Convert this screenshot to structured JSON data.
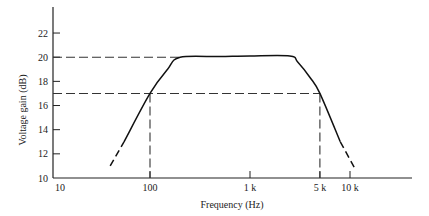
{
  "chart_data": {
    "type": "line",
    "title": "",
    "xlabel": "Frequency (Hz)",
    "ylabel": "Voltage gain (dB)",
    "xscale": "log",
    "xlim": [
      10,
      40000
    ],
    "ylim": [
      10,
      24
    ],
    "grid": false,
    "legend": null,
    "x_ticks": [
      {
        "value": 10,
        "label": "10"
      },
      {
        "value": 100,
        "label": "100"
      },
      {
        "value": 1000,
        "label": "1 k"
      },
      {
        "value": 5000,
        "label": "5 k"
      },
      {
        "value": 10000,
        "label": "10 k"
      }
    ],
    "y_ticks": [
      {
        "value": 10,
        "label": "10"
      },
      {
        "value": 12,
        "label": "12"
      },
      {
        "value": 14,
        "label": "14"
      },
      {
        "value": 16,
        "label": "16"
      },
      {
        "value": 18,
        "label": "18"
      },
      {
        "value": 20,
        "label": "20"
      },
      {
        "value": 22,
        "label": "22"
      }
    ],
    "series": [
      {
        "name": "Frequency response",
        "style": "solid",
        "points": [
          {
            "x": 55,
            "y": 13.0
          },
          {
            "x": 100,
            "y": 17.0
          },
          {
            "x": 150,
            "y": 19.0
          },
          {
            "x": 200,
            "y": 20.0
          },
          {
            "x": 500,
            "y": 20.05
          },
          {
            "x": 1000,
            "y": 20.1
          },
          {
            "x": 2500,
            "y": 20.1
          },
          {
            "x": 3000,
            "y": 19.6
          },
          {
            "x": 4000,
            "y": 18.3
          },
          {
            "x": 5000,
            "y": 17.0
          },
          {
            "x": 8000,
            "y": 13.0
          }
        ]
      },
      {
        "name": "Low-frequency extrapolation",
        "style": "dashed",
        "points": [
          {
            "x": 40,
            "y": 11.0
          },
          {
            "x": 55,
            "y": 13.0
          }
        ]
      },
      {
        "name": "High-frequency extrapolation",
        "style": "dashed",
        "points": [
          {
            "x": 8000,
            "y": 13.0
          },
          {
            "x": 11000,
            "y": 10.9
          }
        ]
      }
    ],
    "annotations": [
      {
        "type": "hline",
        "y": 20,
        "style": "dashed",
        "from_x": 10,
        "to_x": 200,
        "meaning": "midband gain 20 dB"
      },
      {
        "type": "hline",
        "y": 17,
        "style": "dashed",
        "from_x": 10,
        "to_x": 5000,
        "meaning": "-3 dB level 17 dB"
      },
      {
        "type": "vline",
        "x": 100,
        "style": "dashed",
        "from_y": 10,
        "to_y": 17,
        "meaning": "lower cutoff 100 Hz"
      },
      {
        "type": "vline",
        "x": 5000,
        "style": "dashed",
        "from_y": 10,
        "to_y": 17,
        "meaning": "upper cutoff 5 kHz"
      }
    ]
  },
  "colors": {
    "line": "#111111",
    "dashed": "#333333",
    "text": "#222222"
  }
}
